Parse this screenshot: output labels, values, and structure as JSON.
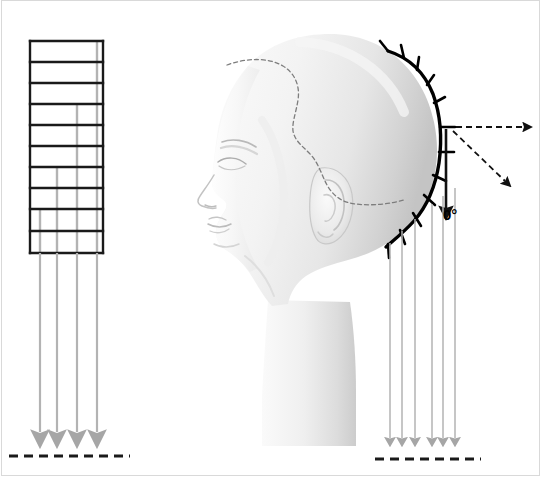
{
  "figure": {
    "background_color": "#ffffff",
    "border_color": "#d9d9d9",
    "width": 552,
    "height": 494
  },
  "colors": {
    "grid_line": "#1a1a1a",
    "guide_line": "#b3b3b3",
    "arrow_gray": "#a6a6a6",
    "dashed_black": "#1a1a1a",
    "head_outline": "#cfcfcf",
    "head_fill_light": "#f2f2f2",
    "head_fill_mid": "#e2e2e2",
    "head_fill_shadow": "#c9c9c9",
    "section_curve": "#000000"
  },
  "left_panel": {
    "name": "section-grid",
    "description": "Rectangular grid of hair sections viewed flat",
    "rows": 10,
    "columns": 5,
    "grid_box": {
      "x": 30,
      "y": 41,
      "width": 73,
      "height": 212
    },
    "row_dividers_y": [
      41,
      62,
      83,
      104,
      125,
      146,
      167,
      188,
      209,
      231,
      253
    ],
    "vertical_guides": [
      {
        "name": "guide-1",
        "x": 97,
        "start_row": 1
      },
      {
        "name": "guide-2",
        "x": 77,
        "start_row": 4
      },
      {
        "name": "guide-3",
        "x": 57,
        "start_row": 7
      },
      {
        "name": "guide-4",
        "x": 40,
        "start_row": 9
      }
    ],
    "arrows": [
      {
        "name": "drop-arrow-1",
        "x": 40,
        "y_start": 253,
        "y_end": 444
      },
      {
        "name": "drop-arrow-2",
        "x": 57,
        "y_start": 253,
        "y_end": 444
      },
      {
        "name": "drop-arrow-3",
        "x": 77,
        "y_start": 253,
        "y_end": 444
      },
      {
        "name": "drop-arrow-4",
        "x": 97,
        "y_start": 253,
        "y_end": 444
      }
    ],
    "baseline": {
      "name": "baseline-dashed-left",
      "x1": 10,
      "x2": 128,
      "y": 455
    }
  },
  "right_panel": {
    "name": "mannequin-head-diagram",
    "description": "Profile view of mannequin head with sectioned hair lengths falling to a 0 degree baseline",
    "hairline_dashed": "dashed sectioning line across crown",
    "section_curve": {
      "name": "back-section-curve",
      "description": "Thick black curve along the back of the head with section tick marks",
      "tick_count": 12
    },
    "elevation": {
      "label": "0°",
      "label_x": 443,
      "label_y": 209,
      "natural_fall_arrow": {
        "name": "zero-degree-arrow",
        "x": 446,
        "y_start": 128,
        "y_end": 212
      },
      "horizontal_dashed_arrow": {
        "name": "ninety-degree-arrow",
        "x1": 455,
        "y1": 127,
        "x2": 527,
        "y2": 127
      },
      "diagonal_dashed_arrow": {
        "name": "forty-five-degree-arrow",
        "x1": 452,
        "y1": 130,
        "x2": 508,
        "y2": 184
      }
    },
    "arrows": [
      {
        "name": "fall-arrow-1",
        "x": 390,
        "y_start": 242,
        "y_end": 446
      },
      {
        "name": "fall-arrow-2",
        "x": 402,
        "y_start": 230,
        "y_end": 446
      },
      {
        "name": "fall-arrow-3",
        "x": 415,
        "y_start": 218,
        "y_end": 446
      },
      {
        "name": "fall-arrow-4",
        "x": 432,
        "y_start": 205,
        "y_end": 446
      },
      {
        "name": "fall-arrow-5",
        "x": 443,
        "y_start": 196,
        "y_end": 446
      },
      {
        "name": "fall-arrow-6",
        "x": 455,
        "y_start": 188,
        "y_end": 446
      }
    ],
    "baseline": {
      "name": "baseline-dashed-right",
      "x1": 375,
      "x2": 480,
      "y": 459
    }
  }
}
